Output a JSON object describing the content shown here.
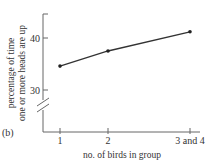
{
  "chart_data": {
    "type": "line",
    "panel_label": "(b)",
    "title": "",
    "xlabel": "no. of birds in group",
    "ylabel_lines": [
      "percentage of time",
      "one or more heads are up"
    ],
    "categories": [
      "1",
      "2",
      "3 and 4"
    ],
    "x": [
      1,
      2,
      3
    ],
    "series": [
      {
        "name": "heads up",
        "values": [
          34.6,
          37.5,
          41.2
        ]
      }
    ],
    "yticks": [
      30,
      40
    ],
    "ytick_labels": [
      "30",
      "40"
    ],
    "ylim": [
      30,
      44.6
    ],
    "y_axis_break": true,
    "grid": false,
    "legend": "none"
  }
}
